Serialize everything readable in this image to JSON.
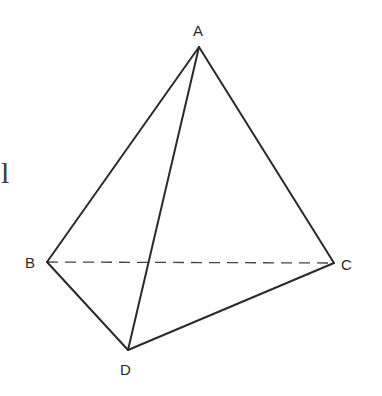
{
  "diagram": {
    "type": "tetrahedron",
    "stray_mark": "l",
    "vertices": {
      "A": {
        "label": "A",
        "x": 199,
        "y": 47
      },
      "B": {
        "label": "B",
        "x": 47,
        "y": 262
      },
      "C": {
        "label": "C",
        "x": 334,
        "y": 263
      },
      "D": {
        "label": "D",
        "x": 128,
        "y": 350
      }
    },
    "edges": [
      {
        "from": "A",
        "to": "B",
        "style": "solid"
      },
      {
        "from": "A",
        "to": "C",
        "style": "solid"
      },
      {
        "from": "A",
        "to": "D",
        "style": "solid"
      },
      {
        "from": "B",
        "to": "D",
        "style": "solid"
      },
      {
        "from": "D",
        "to": "C",
        "style": "solid"
      },
      {
        "from": "B",
        "to": "C",
        "style": "dashed"
      }
    ],
    "colors": {
      "line": "#2a2a2a",
      "background": "#ffffff"
    }
  }
}
